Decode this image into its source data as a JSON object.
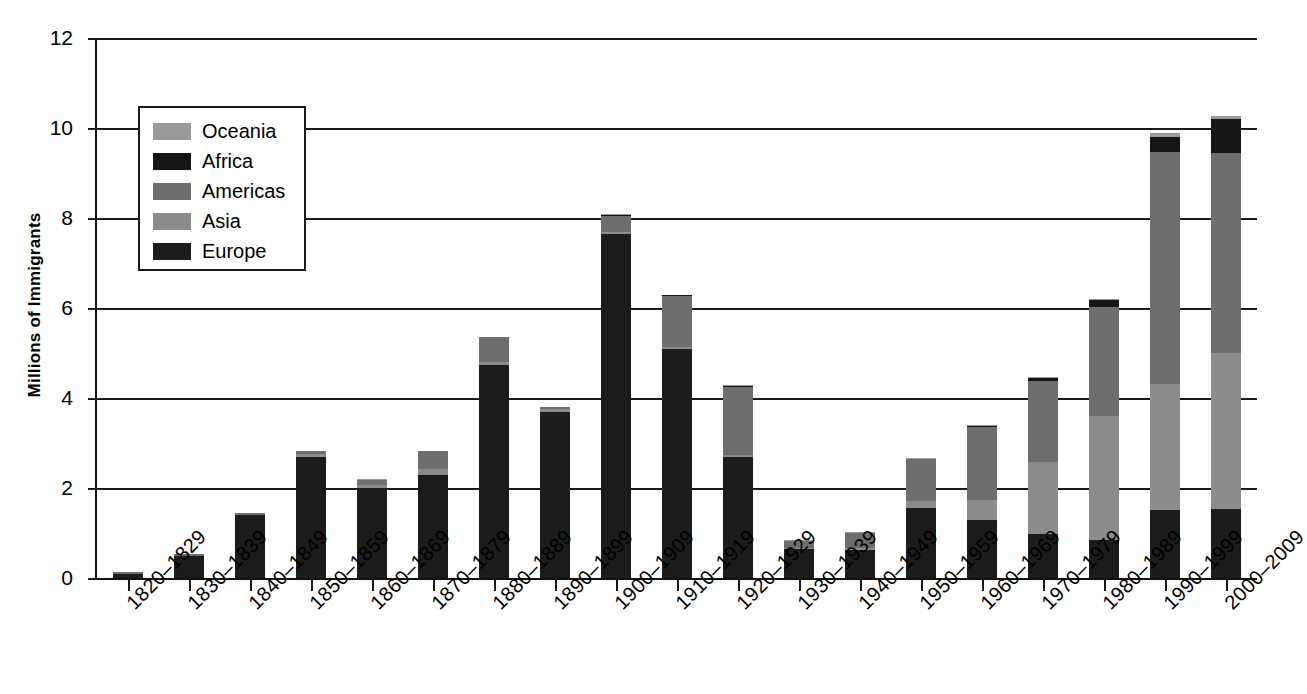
{
  "chart_data": {
    "type": "bar",
    "stacked": true,
    "title": "",
    "xlabel": "",
    "ylabel": "Millions of Immigrants",
    "ylim": [
      0,
      12
    ],
    "ytick_labels": [
      "0",
      "2",
      "4",
      "6",
      "8",
      "10",
      "12"
    ],
    "ytick_values": [
      0,
      2,
      4,
      6,
      8,
      10,
      12
    ],
    "grid": true,
    "legend_position": "upper-left-inside",
    "categories": [
      "1820–1829",
      "1830–1839",
      "1840–1849",
      "1850–1859",
      "1860–1869",
      "1870–1879",
      "1880–1889",
      "1890–1899",
      "1900–1909",
      "1910–1919",
      "1920–1929",
      "1930–1939",
      "1940–1949",
      "1950–1959",
      "1960–1969",
      "1970–1979",
      "1980–1989",
      "1990–1999",
      "2000–2009"
    ],
    "series": [
      {
        "name": "Europe",
        "color": "#1c1c1c",
        "values": [
          0.1,
          0.5,
          1.4,
          2.7,
          2.0,
          2.3,
          4.73,
          3.7,
          7.65,
          5.1,
          2.7,
          0.65,
          0.62,
          1.55,
          1.3,
          0.98,
          0.85,
          1.52,
          1.54
        ]
      },
      {
        "name": "Asia",
        "color": "#8c8c8c",
        "values": [
          0.0,
          0.0,
          0.0,
          0.05,
          0.06,
          0.12,
          0.07,
          0.06,
          0.04,
          0.03,
          0.03,
          0.02,
          0.04,
          0.16,
          0.43,
          1.59,
          2.76,
          2.8,
          3.47
        ]
      },
      {
        "name": "Americas",
        "color": "#6e6e6e",
        "values": [
          0.03,
          0.04,
          0.04,
          0.07,
          0.12,
          0.4,
          0.55,
          0.04,
          0.36,
          1.14,
          1.52,
          0.16,
          0.35,
          0.93,
          1.62,
          1.8,
          2.42,
          5.14,
          4.44
        ]
      },
      {
        "name": "Africa",
        "color": "#151515",
        "values": [
          0.0,
          0.0,
          0.0,
          0.0,
          0.0,
          0.0,
          0.0,
          0.0,
          0.01,
          0.01,
          0.01,
          0.0,
          0.0,
          0.01,
          0.03,
          0.08,
          0.14,
          0.35,
          0.76
        ]
      },
      {
        "name": "Oceania",
        "color": "#9a9a9a",
        "values": [
          0.0,
          0.0,
          0.0,
          0.01,
          0.01,
          0.01,
          0.01,
          0.01,
          0.02,
          0.02,
          0.02,
          0.01,
          0.01,
          0.01,
          0.01,
          0.02,
          0.03,
          0.07,
          0.06
        ]
      }
    ],
    "totals": [
      0.13,
      0.54,
      1.44,
      2.83,
      2.19,
      2.83,
      5.36,
      3.81,
      8.08,
      6.3,
      4.28,
      0.84,
      1.02,
      2.66,
      3.39,
      4.47,
      6.2,
      9.88,
      10.27
    ]
  },
  "legend": {
    "entries": [
      {
        "label": "Oceania",
        "color": "#9a9a9a"
      },
      {
        "label": "Africa",
        "color": "#151515"
      },
      {
        "label": "Americas",
        "color": "#6e6e6e"
      },
      {
        "label": "Asia",
        "color": "#8c8c8c"
      },
      {
        "label": "Europe",
        "color": "#1c1c1c"
      }
    ]
  },
  "axis": {
    "y_title": "Millions of Immigrants"
  }
}
